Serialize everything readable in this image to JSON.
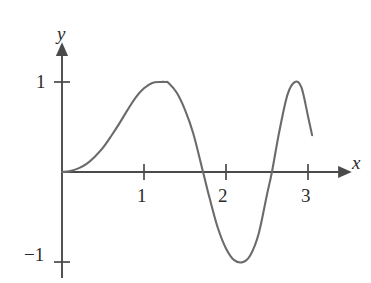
{
  "figure": {
    "title": "",
    "background_color": "#ffffff",
    "axis_color": "#4a4a4a",
    "curve_color": "#6b6b6b",
    "text_color": "#2b2b2b"
  },
  "axes": {
    "x_label": "x",
    "y_label": "y",
    "x_ticks": [
      {
        "value": 1,
        "label": "1"
      },
      {
        "value": 2,
        "label": "2"
      },
      {
        "value": 3,
        "label": "3"
      }
    ],
    "y_ticks": [
      {
        "value": 1,
        "label": "1"
      },
      {
        "value": -1,
        "label": "−1"
      }
    ],
    "x_range": [
      -0.08,
      3.45
    ],
    "y_range": [
      -1.45,
      1.38
    ],
    "origin_px": [
      62,
      172
    ],
    "x_unit_px": 82,
    "y_unit_px": 90
  },
  "chart_data": {
    "type": "line",
    "title": "",
    "xlabel": "x",
    "ylabel": "y",
    "xlim": [
      0,
      3.45
    ],
    "ylim": [
      -1.4,
      1.35
    ],
    "grid": false,
    "legend": null,
    "series": [
      {
        "name": "curve",
        "color": "#6b6b6b",
        "x_start": 0.0,
        "x_end": 3.05,
        "key_points": {
          "start": {
            "x": 0.0,
            "y": 0.0
          },
          "maximum_1": {
            "x": 1.26,
            "y": 1.0
          },
          "zero_crossing_1": {
            "x": 1.72,
            "y": 0.0
          },
          "minimum_1": {
            "x": 2.21,
            "y": -1.0
          },
          "zero_crossing_2": {
            "x": 2.56,
            "y": 0.0
          },
          "maximum_2": {
            "x": 2.84,
            "y": 1.0
          },
          "end": {
            "x": 3.05,
            "y": 0.41
          }
        },
        "x": [
          0.0,
          0.1,
          0.2,
          0.3,
          0.4,
          0.5,
          0.6,
          0.7,
          0.8,
          0.9,
          1.0,
          1.1,
          1.2,
          1.26,
          1.3,
          1.4,
          1.5,
          1.6,
          1.72,
          1.8,
          1.9,
          2.0,
          2.1,
          2.21,
          2.3,
          2.4,
          2.5,
          2.56,
          2.65,
          2.75,
          2.84,
          2.92,
          3.0,
          3.05
        ],
        "y": [
          0.0,
          0.01,
          0.04,
          0.09,
          0.17,
          0.27,
          0.4,
          0.54,
          0.69,
          0.83,
          0.93,
          0.99,
          1.0,
          1.0,
          0.99,
          0.88,
          0.69,
          0.43,
          0.0,
          -0.29,
          -0.62,
          -0.85,
          -0.98,
          -1.0,
          -0.92,
          -0.68,
          -0.25,
          0.0,
          0.45,
          0.86,
          1.0,
          0.94,
          0.62,
          0.41
        ]
      }
    ]
  }
}
